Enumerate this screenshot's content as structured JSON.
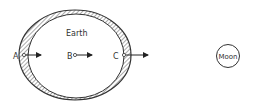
{
  "diagram": {
    "type": "tidal-bulge-diagram",
    "labels": {
      "earth": "Earth",
      "moon": "Moon",
      "point_a": "A",
      "point_b": "B",
      "point_c": "C"
    },
    "colors": {
      "stroke": "#333333",
      "hatch": "#666666",
      "background": "#ffffff"
    }
  }
}
